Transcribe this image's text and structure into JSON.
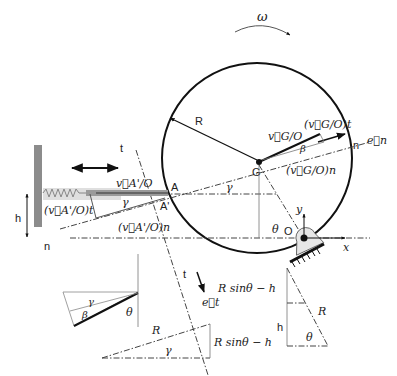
{
  "diagram": {
    "labels": {
      "omega": "ω",
      "radius_top": "R",
      "t_upper": "t",
      "t_lower": "t",
      "n_left": "n",
      "n_right": "n",
      "point_A": "A",
      "point_A_prime": "A'",
      "point_G": "G",
      "point_O": "O",
      "axis_x": "x",
      "axis_y": "y",
      "h_left": "h",
      "v_A_O": "v⃗A'/O",
      "v_A_O_t": "(v⃗A'/O)t",
      "v_A_O_n": "(v⃗A'/O)n",
      "v_G_O": "v⃗G/O",
      "v_G_O_t": "(v⃗G/O)t",
      "v_G_O_n": "(v⃗G/O)n",
      "e_n": "e⃗n",
      "e_t": "e⃗t",
      "gamma_A": "γ",
      "gamma_G": "γ",
      "beta_G": "β",
      "theta_O": "θ"
    },
    "inset_triangle_left": {
      "gamma": "γ",
      "beta": "β",
      "theta": "θ"
    },
    "inset_triangle_bottom": {
      "hyp": "R",
      "angle": "γ",
      "side": "R sinθ − h"
    },
    "inset_triangle_right": {
      "top_side": "R sinθ − h",
      "h": "h",
      "hyp": "R",
      "angle": "θ"
    },
    "colors": {
      "line": "#111111",
      "guide": "#444444",
      "wall": "#888888",
      "rod": "#9a9a9a",
      "support_fill": "#e6e6e6"
    }
  }
}
